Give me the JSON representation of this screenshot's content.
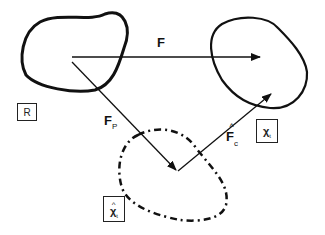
{
  "diagram": {
    "title": "",
    "colors": {
      "stroke": "#111111",
      "background": "#ffffff"
    },
    "regions": [
      {
        "id": "R",
        "label": "R",
        "style": "solid",
        "description": "reference configuration region (left)"
      },
      {
        "id": "chi_t",
        "label": "χ",
        "subscript": "t",
        "style": "solid",
        "description": "current configuration region (right)"
      },
      {
        "id": "chi_hat_t",
        "label": "χ",
        "hat": "^",
        "subscript": "t",
        "style": "dashed",
        "description": "intermediate configuration region (bottom)"
      }
    ],
    "arrows": [
      {
        "id": "F",
        "label": "F",
        "from": "R",
        "to": "chi_t"
      },
      {
        "id": "F_p",
        "label": "F",
        "subscript": "P",
        "from": "R",
        "to": "chi_hat_t"
      },
      {
        "id": "F_c_hat",
        "label": "F",
        "hat": "^",
        "subscript": "c",
        "from": "chi_hat_t",
        "to": "chi_t"
      }
    ]
  }
}
